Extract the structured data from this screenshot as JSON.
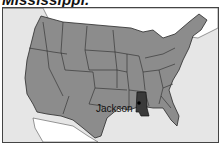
{
  "title": "Mississippi.",
  "map": {
    "region": "United States",
    "highlighted_state": "Mississippi",
    "capital_label": "Jackson",
    "colors": {
      "ocean": "#e6e6e6",
      "foreign_land": "#ffffff",
      "states": "#8c8c8c",
      "highlight": "#3a3a3a",
      "borders": "#2a2a2a"
    }
  }
}
